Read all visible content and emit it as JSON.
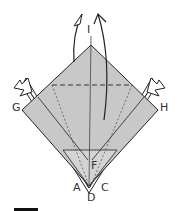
{
  "diagram": {
    "type": "origami-step",
    "labels": {
      "top": "I",
      "left": "G",
      "right": "H",
      "bottom_left": "A",
      "bottom_center": "D",
      "bottom_right": "C",
      "inner": "F"
    },
    "colors": {
      "paper": "#c8c8c8",
      "outline": "#222222",
      "background": "#ffffff"
    },
    "arrows": [
      "lift-flap-up-left",
      "lift-flap-up-right",
      "push-in-left",
      "push-in-right"
    ],
    "lines": [
      "valley-fold-horizontal-dashed",
      "mountain-fold-diagonals-dotted"
    ]
  }
}
